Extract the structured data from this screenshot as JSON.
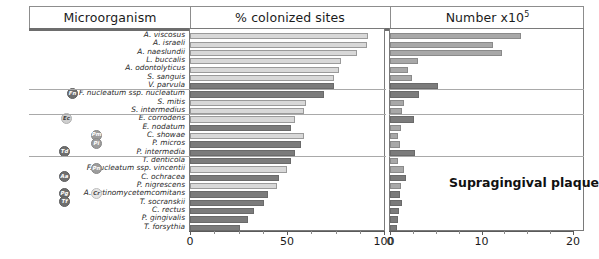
{
  "header": {
    "col_microorganism": "Microorganism",
    "col_percent": "% colonized sites",
    "col_number": "Number x10",
    "col_number_exponent": "5"
  },
  "annotation": {
    "label": "Supragingival plaque"
  },
  "axes": {
    "left": {
      "ticks": [
        "0",
        "50",
        "100"
      ],
      "min": 0,
      "max": 100
    },
    "right": {
      "ticks": [
        "0",
        "10",
        "20"
      ],
      "min": 0,
      "max": 20
    }
  },
  "badges": [
    {
      "code": "Fn",
      "tone": "g-dark",
      "row": 7
    },
    {
      "code": "Ec",
      "tone": "g-light",
      "row": 10
    },
    {
      "code": "Pm",
      "tone": "g-mid",
      "row": 12
    },
    {
      "code": "Pi",
      "tone": "g-mid",
      "row": 13
    },
    {
      "code": "Td",
      "tone": "g-dark",
      "row": 14
    },
    {
      "code": "Pn",
      "tone": "g-mid",
      "row": 16
    },
    {
      "code": "Aa",
      "tone": "g-dark",
      "row": 17
    },
    {
      "code": "Cr",
      "tone": "g-xlight",
      "row": 19
    },
    {
      "code": "Pg",
      "tone": "g-dark",
      "row": 19
    },
    {
      "code": "Tf",
      "tone": "g-dark",
      "row": 20
    }
  ],
  "group_dividers": [
    7,
    10,
    15
  ],
  "chart_data": {
    "type": "bar",
    "title": "Supragingival plaque",
    "orientation": "horizontal",
    "categories": [
      "A. viscosus",
      "A. israeli",
      "A. naeslundii",
      "L. buccalis",
      "A. odontolyticus",
      "S. sanguis",
      "V. parvula",
      "F. nucleatum ssp. nucleatum",
      "S. mitis",
      "S. intermedius",
      "E. corrodens",
      "E. nodatum",
      "C. showae",
      "P. micros",
      "P. intermedia",
      "T. denticola",
      "F. nucleatum ssp. vincentii",
      "C. ochracea",
      "P. nigrescens",
      "A. actinomycetemcomitans",
      "T. socranskii",
      "C. rectus",
      "P. gingivalis",
      "T. forsythia"
    ],
    "series": [
      {
        "name": "% colonized sites",
        "xlabel": "% colonized sites",
        "xlim": [
          0,
          100
        ],
        "values": [
          92,
          91,
          86,
          78,
          77,
          74,
          74,
          69,
          60,
          59,
          54,
          52,
          59,
          57,
          54,
          52,
          50,
          46,
          45,
          40,
          38,
          33,
          30,
          26
        ],
        "tones": [
          "light",
          "light",
          "light",
          "light",
          "light",
          "light",
          "dark",
          "dark",
          "light",
          "light",
          "light",
          "dark",
          "light",
          "dark",
          "dark",
          "dark",
          "light",
          "dark",
          "light",
          "dark",
          "dark",
          "dark",
          "dark",
          "dark"
        ]
      },
      {
        "name": "Number x10^5",
        "xlabel": "Number x10",
        "xlim": [
          0,
          20
        ],
        "values": [
          14.3,
          11.3,
          12.2,
          3.1,
          2.0,
          2.4,
          5.2,
          3.2,
          1.5,
          1.3,
          2.6,
          1.2,
          0.9,
          1.1,
          2.7,
          0.9,
          1.5,
          1.7,
          1.2,
          1.1,
          1.3,
          1.0,
          0.9,
          0.8
        ],
        "tones": [
          "mid",
          "mid",
          "mid",
          "mid",
          "mid",
          "mid",
          "dark",
          "dark",
          "mid",
          "mid",
          "dark",
          "mid",
          "mid",
          "mid",
          "dark",
          "mid",
          "mid",
          "dark",
          "mid",
          "dark",
          "dark",
          "dark",
          "dark",
          "dark"
        ]
      }
    ],
    "grid": false,
    "legend": "none"
  }
}
